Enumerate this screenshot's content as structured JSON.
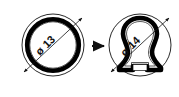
{
  "figure": {
    "type": "engineering-deformation-diagram",
    "background_color": "#ffffff",
    "line_color": "#111111",
    "ring_fill_color": "#000000",
    "panels": [
      {
        "id": "before",
        "name": "undeformed-ring",
        "shape": "circle",
        "dimension_label": "ø 13",
        "dimension_value": 13,
        "dimension_symbol": "ø",
        "center": {
          "x": 53,
          "y": 45
        },
        "outer_radius": 31,
        "ring_outer_radius": 28,
        "ring_inner_radius": 23.5
      },
      {
        "id": "after",
        "name": "deformed-ring",
        "shape": "tri-lobed",
        "dimension_label": "ø 14",
        "dimension_value": 14,
        "dimension_symbol": "ø",
        "center": {
          "x": 140,
          "y": 45
        },
        "outer_radius": 31,
        "has_bottom_notch": true
      }
    ],
    "transition_arrow": {
      "name": "transition-arrow",
      "direction": "right",
      "from_panel": "before",
      "to_panel": "after"
    },
    "dimension_lines": [
      {
        "panel": "before",
        "angle_deg": -45,
        "arrowheads": "both",
        "label": "ø 13"
      },
      {
        "panel": "after",
        "angle_deg": -45,
        "arrowheads": "both",
        "label": "ø 14"
      }
    ]
  }
}
